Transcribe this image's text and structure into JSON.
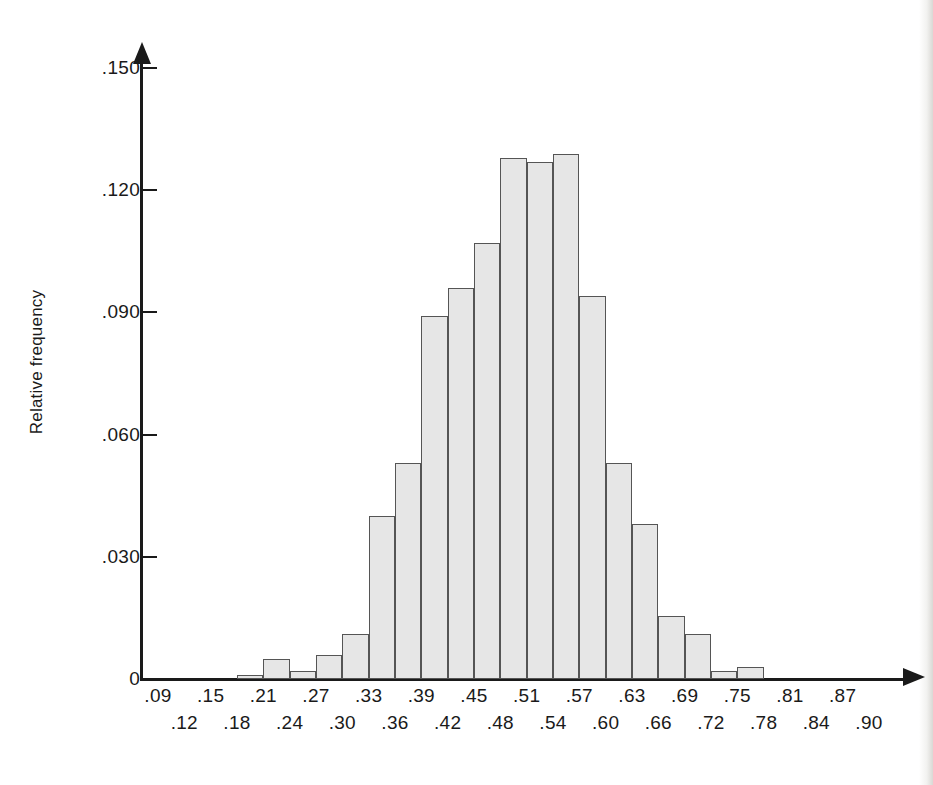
{
  "figure": {
    "type": "histogram",
    "y_axis_title": "Relative frequency"
  },
  "chart_data": {
    "type": "bar",
    "title": "",
    "xlabel": "",
    "ylabel": "Relative frequency",
    "ylim": [
      0,
      0.155
    ],
    "xlim": [
      0.09,
      0.93
    ],
    "grid": false,
    "legend": "none",
    "bin_width": 0.03,
    "y_ticks": [
      "0",
      ".030",
      ".060",
      ".090",
      ".120",
      ".150"
    ],
    "y_tick_values": [
      0,
      0.03,
      0.06,
      0.09,
      0.12,
      0.15
    ],
    "x_ticks_top_row": [
      ".09",
      ".15",
      ".21",
      ".27",
      ".33",
      ".39",
      ".45",
      ".51",
      ".57",
      ".63",
      ".69",
      ".75",
      ".81",
      ".87"
    ],
    "x_ticks_bottom_row": [
      ".12",
      ".18",
      ".24",
      ".30",
      ".36",
      ".42",
      ".48",
      ".54",
      ".60",
      ".66",
      ".72",
      ".78",
      ".84",
      ".90"
    ],
    "bin_edges": [
      0.18,
      0.21,
      0.24,
      0.27,
      0.3,
      0.33,
      0.36,
      0.39,
      0.42,
      0.45,
      0.48,
      0.51,
      0.54,
      0.57,
      0.6,
      0.63,
      0.66,
      0.69,
      0.72,
      0.75,
      0.78
    ],
    "categories": [
      ".18-.21",
      ".21-.24",
      ".24-.27",
      ".27-.30",
      ".30-.33",
      ".33-.36",
      ".36-.39",
      ".39-.42",
      ".42-.45",
      ".45-.48",
      ".48-.51",
      ".51-.54",
      ".54-.57",
      ".57-.60",
      ".60-.63",
      ".63-.66",
      ".66-.69",
      ".69-.72",
      ".72-.75",
      ".75-.78"
    ],
    "values": [
      0.001,
      0.005,
      0.002,
      0.006,
      0.011,
      0.04,
      0.053,
      0.089,
      0.096,
      0.107,
      0.128,
      0.127,
      0.129,
      0.094,
      0.053,
      0.038,
      0.0155,
      0.011,
      0.002,
      0.003
    ]
  }
}
